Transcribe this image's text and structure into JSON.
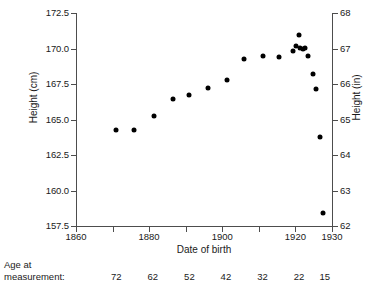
{
  "chart_data": {
    "type": "scatter",
    "title": "",
    "xlabel": "Date of birth",
    "ylabel": "Height (cm)",
    "ylabel_right": "Height (in)",
    "xlim": [
      1860,
      1930
    ],
    "ylim": [
      157.5,
      172.5
    ],
    "ylim_right": [
      62,
      68
    ],
    "grid": false,
    "legend": null,
    "x_ticks": [
      1860,
      1870,
      1880,
      1890,
      1900,
      1910,
      1920,
      1930
    ],
    "x_tick_labels": [
      "1860",
      "",
      "1880",
      "",
      "1900",
      "",
      "1920",
      "1930"
    ],
    "y_ticks_left": [
      157.5,
      160.0,
      162.5,
      165.0,
      167.5,
      170.0,
      172.5
    ],
    "y_tick_labels_left": [
      "157.5",
      "160.0",
      "162.5",
      "165.0",
      "167.5",
      "170.0",
      "172.5"
    ],
    "y_ticks_right": [
      62,
      63,
      64,
      65,
      66,
      67,
      68
    ],
    "y_tick_labels_right": [
      "62",
      "63",
      "64",
      "65",
      "66",
      "67",
      "68"
    ],
    "secondary_axis": {
      "label": "Age at measurement:",
      "label_line1": "Age at",
      "label_line2": "measurement:",
      "values": [
        "72",
        "62",
        "52",
        "42",
        "32",
        "22",
        "15"
      ],
      "at_years": [
        1871,
        1881,
        1891,
        1901,
        1911,
        1921,
        1928
      ]
    },
    "marker": {
      "shape": "circle",
      "color": "#000000",
      "size": 5
    },
    "points": [
      {
        "x": 1871.0,
        "y": 164.25
      },
      {
        "x": 1875.8,
        "y": 164.25
      },
      {
        "x": 1881.2,
        "y": 165.25
      },
      {
        "x": 1886.5,
        "y": 166.45
      },
      {
        "x": 1891.0,
        "y": 166.75
      },
      {
        "x": 1896.0,
        "y": 167.2
      },
      {
        "x": 1901.2,
        "y": 167.75
      },
      {
        "x": 1906.0,
        "y": 169.25
      },
      {
        "x": 1911.0,
        "y": 169.5
      },
      {
        "x": 1915.5,
        "y": 169.4
      },
      {
        "x": 1919.2,
        "y": 169.8
      },
      {
        "x": 1920.2,
        "y": 170.15
      },
      {
        "x": 1921.0,
        "y": 170.95
      },
      {
        "x": 1921.3,
        "y": 170.05
      },
      {
        "x": 1922.0,
        "y": 169.95
      },
      {
        "x": 1922.6,
        "y": 170.05
      },
      {
        "x": 1923.5,
        "y": 169.45
      },
      {
        "x": 1924.8,
        "y": 168.2
      },
      {
        "x": 1925.5,
        "y": 167.15
      },
      {
        "x": 1926.8,
        "y": 163.8
      },
      {
        "x": 1927.6,
        "y": 158.45
      }
    ]
  },
  "colors": {
    "marker": "#000000",
    "axis": "#4d4d4d",
    "text": "#1a1a1a",
    "background": "#ffffff"
  }
}
